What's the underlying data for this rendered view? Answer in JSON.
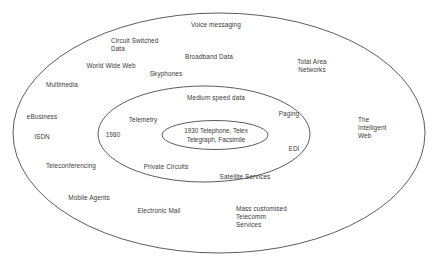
{
  "diagram": {
    "type": "concentric-ellipse-venn",
    "title_visible": false,
    "stroke_color": "#4a4a4a",
    "text_color": "#3a3a3a",
    "background_color": "#ffffff",
    "rings": [
      {
        "id": "outer-ring",
        "name": "outer-ellipse",
        "cx": 219,
        "cy": 133,
        "rx": 206,
        "ry": 120
      },
      {
        "id": "middle-ring",
        "name": "middle-ellipse",
        "cx": 204,
        "cy": 134,
        "rx": 106,
        "ry": 48
      },
      {
        "id": "inner-ring",
        "name": "inner-ellipse",
        "cx": 215,
        "cy": 135,
        "rx": 53,
        "ry": 14
      }
    ],
    "core_label": "1930 Telephone, Telex\nTelegraph, Facsimile",
    "era_label": "1980",
    "labels_outer": [
      {
        "key": "voice_messaging",
        "text": "Voice messaging"
      },
      {
        "key": "circuit_switched",
        "text": "Circuit Switched\nData"
      },
      {
        "key": "broadband_data",
        "text": "Broadband Data"
      },
      {
        "key": "world_wide_web",
        "text": "World Wide Web"
      },
      {
        "key": "skyphones",
        "text": "Skyphones"
      },
      {
        "key": "total_area",
        "text": "Total Area\nNetworks"
      },
      {
        "key": "multimedia",
        "text": "Multimedia"
      },
      {
        "key": "ebusiness",
        "text": "eBusiness"
      },
      {
        "key": "isdn",
        "text": "ISDN"
      },
      {
        "key": "teleconferencing",
        "text": "Teleconferencing"
      },
      {
        "key": "mobile_agents",
        "text": "Mobile Agents"
      },
      {
        "key": "electronic_mail",
        "text": "Electronic Mail"
      },
      {
        "key": "mass_customised",
        "text": "Mass customised\nTelecomm\nServices"
      },
      {
        "key": "intelligent_web",
        "text": "The\nIntelligent\nWeb"
      }
    ],
    "labels_middle": [
      {
        "key": "medium_speed",
        "text": "Medium speed data"
      },
      {
        "key": "paging",
        "text": "Paging"
      },
      {
        "key": "telemetry",
        "text": "Telemetry"
      },
      {
        "key": "edi",
        "text": "EDI"
      },
      {
        "key": "private_circuits",
        "text": "Private Circuits"
      },
      {
        "key": "satellite",
        "text": "Satellite Services"
      }
    ]
  },
  "text": {
    "voice_messaging": "Voice messaging",
    "circuit_switched": "Circuit Switched\nData",
    "broadband_data": "Broadband Data",
    "world_wide_web": "World Wide Web",
    "skyphones": "Skyphones",
    "total_area": "Total Area\nNetworks",
    "multimedia": "Multimedia",
    "ebusiness": "eBusiness",
    "isdn": "ISDN",
    "teleconferencing": "Teleconferencing",
    "mobile_agents": "Mobile Agents",
    "electronic_mail": "Electronic Mail",
    "mass_customised": "Mass customised\nTelecomm\nServices",
    "intelligent_web": "The\nIntelligent\nWeb",
    "medium_speed": "Medium speed data",
    "paging": "Paging",
    "telemetry": "Telemetry",
    "edi": "EDI",
    "private_circuits": "Private Circuits",
    "satellite": "Satellite Services",
    "era_1980": "1980",
    "core": "1930 Telephone, Telex\nTelegraph, Facsimile"
  }
}
